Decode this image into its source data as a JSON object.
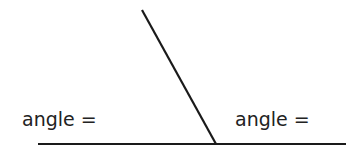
{
  "diagram": {
    "type": "angles-on-a-straight-line",
    "line_color": "#1a1a1a",
    "text_color": "#222222",
    "labels": {
      "left": "angle =",
      "right": "angle ="
    },
    "base_line": {
      "x1": 38,
      "y1": 144,
      "x2": 346,
      "y2": 144
    },
    "ray": {
      "x1": 142,
      "y1": 10,
      "x2": 216,
      "y2": 144
    }
  }
}
